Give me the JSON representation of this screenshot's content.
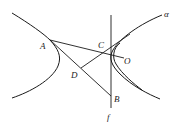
{
  "figure": {
    "type": "geometry-diagram",
    "labels": {
      "A": "A",
      "B": "B",
      "C": "C",
      "D": "D",
      "O": "O",
      "f": "f",
      "alpha": "α"
    },
    "segments": [
      "AO",
      "AB",
      "DC",
      "f"
    ],
    "curves": [
      "hyperbola-left-branch",
      "hyperbola-right-branch",
      "arc-near-O"
    ]
  }
}
